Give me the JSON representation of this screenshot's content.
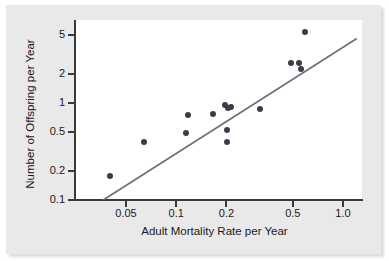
{
  "chart_data": {
    "type": "scatter",
    "title": "",
    "xlabel": "Adult Mortality Rate per Year",
    "ylabel": "Number of Offspring per Year",
    "xscale": "log",
    "yscale": "log",
    "xlim": [
      0.035,
      1.25
    ],
    "ylim": [
      0.1,
      6.5
    ],
    "grid": false,
    "legend": null,
    "xticks": [
      "0.05",
      "0.1",
      "0.2",
      "0.5",
      "1.0"
    ],
    "xtick_values": [
      0.05,
      0.1,
      0.2,
      0.5,
      1.0
    ],
    "yticks": [
      "0.1",
      "0.2",
      "0.5",
      "1",
      "2",
      "5"
    ],
    "ytick_values": [
      0.1,
      0.2,
      0.5,
      1,
      2,
      5
    ],
    "marker_color": "#3c3c48",
    "line_color": "#6e6e78",
    "points": [
      {
        "x": 0.04,
        "y": 0.175
      },
      {
        "x": 0.064,
        "y": 0.4
      },
      {
        "x": 0.115,
        "y": 0.49
      },
      {
        "x": 0.118,
        "y": 0.75
      },
      {
        "x": 0.167,
        "y": 0.76
      },
      {
        "x": 0.196,
        "y": 0.96
      },
      {
        "x": 0.205,
        "y": 0.88
      },
      {
        "x": 0.212,
        "y": 0.91
      },
      {
        "x": 0.203,
        "y": 0.53
      },
      {
        "x": 0.201,
        "y": 0.4
      },
      {
        "x": 0.318,
        "y": 0.87
      },
      {
        "x": 0.485,
        "y": 2.55
      },
      {
        "x": 0.545,
        "y": 2.6
      },
      {
        "x": 0.56,
        "y": 2.25
      },
      {
        "x": 0.595,
        "y": 5.4
      }
    ],
    "trend_line": {
      "description": "reference line of slope 1 through origin on log-log axes",
      "x_start": 0.0365,
      "y_start": 0.1,
      "x_end": 1.21,
      "y_end": 4.6
    }
  },
  "axes": {
    "x_title": "Adult Mortality Rate per Year",
    "y_title": "Number of Offspring per Year",
    "x_tick_labels": [
      "0.05",
      "0.1",
      "0.2",
      "0.5",
      "1.0"
    ],
    "y_tick_labels": [
      "5",
      "2",
      "1",
      "0.5",
      "0.2",
      "0.1"
    ]
  },
  "colors": {
    "marker": "#3c3c48",
    "trend": "#6e6e78",
    "axis": "#3a3a3a",
    "backdrop": "#e9e9e9",
    "canvas": "#ffffff"
  }
}
